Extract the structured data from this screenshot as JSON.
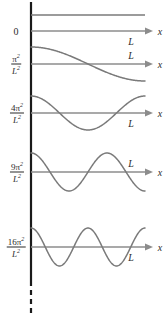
{
  "figure": {
    "axis_x_label": "x",
    "box_length_label": "L",
    "ground_label": "0",
    "colors": {
      "curve": "#7a7a7a",
      "axis": "#8c8c8c",
      "vertical_axis": "#1a1a1a",
      "text": "#2b2b2b",
      "background": "#ffffff"
    },
    "vertical_axis": {
      "x": 31,
      "solid_top": 2,
      "solid_bottom": 281,
      "dashed_bottom": 313
    },
    "levels": [
      {
        "index": 0,
        "energy_numerator": "0",
        "energy_denominator": "",
        "energy_is_fraction": false,
        "axis_y": 31,
        "curve_y": 15,
        "amplitude": 0,
        "half_periods": 0,
        "shape": "flat",
        "L_label_position": "below",
        "L_x": 131,
        "L_y": 41,
        "x_label_x": 160,
        "x_label_y": 31
      },
      {
        "index": 1,
        "energy_numerator": "π²",
        "energy_denominator": "L²",
        "energy_is_fraction": true,
        "axis_y": 64,
        "curve_y": 64,
        "amplitude": 17,
        "half_periods": 1,
        "shape": "cosine",
        "L_label_position": "above",
        "L_x": 131,
        "L_y": 55,
        "x_label_x": 160,
        "x_label_y": 64
      },
      {
        "index": 2,
        "energy_numerator": "4π²",
        "energy_denominator": "L²",
        "energy_is_fraction": true,
        "axis_y": 113,
        "curve_y": 113,
        "amplitude": 17,
        "half_periods": 2,
        "shape": "cosine",
        "L_label_position": "below",
        "L_x": 131,
        "L_y": 123,
        "x_label_x": 160,
        "x_label_y": 113
      },
      {
        "index": 3,
        "energy_numerator": "9π²",
        "energy_denominator": "L²",
        "energy_is_fraction": true,
        "axis_y": 172,
        "curve_y": 172,
        "amplitude": 19,
        "half_periods": 3,
        "shape": "cosine",
        "L_label_position": "above",
        "L_x": 131,
        "L_y": 163,
        "x_label_x": 160,
        "x_label_y": 172
      },
      {
        "index": 4,
        "energy_numerator": "16π²",
        "energy_denominator": "L²",
        "energy_is_fraction": true,
        "axis_y": 247,
        "curve_y": 247,
        "amplitude": 19,
        "half_periods": 4,
        "shape": "cosine",
        "L_label_position": "below",
        "L_x": 131,
        "L_y": 257,
        "x_label_x": 160,
        "x_label_y": 247
      }
    ],
    "label_positions": [
      {
        "x": 16,
        "y": 31
      },
      {
        "x": 16,
        "y": 64
      },
      {
        "x": 17,
        "y": 113
      },
      {
        "x": 17,
        "y": 172
      },
      {
        "x": 16,
        "y": 247
      }
    ],
    "geometry": {
      "curve_start_x": 31,
      "curve_end_x": 145,
      "axis_start_x": 31,
      "axis_end_x": 146,
      "arrow_tip_x": 153
    }
  },
  "chart_data": {
    "type": "line",
    "xlabel": "x",
    "ylabel": "",
    "grid": false,
    "legend": "none",
    "x": [
      0,
      "L"
    ],
    "series": [
      {
        "name": "E = 0",
        "energy": "0",
        "half_periods": 0,
        "values": "constant"
      },
      {
        "name": "E = π²/L²",
        "energy": "π²/L²",
        "half_periods": 1,
        "values": "cos(πx/L)"
      },
      {
        "name": "E = 4π²/L²",
        "energy": "4π²/L²",
        "half_periods": 2,
        "values": "cos(2πx/L)"
      },
      {
        "name": "E = 9π²/L²",
        "energy": "9π²/L²",
        "half_periods": 3,
        "values": "cos(3πx/L)"
      },
      {
        "name": "E = 16π²/L²",
        "energy": "16π²/L²",
        "half_periods": 4,
        "values": "cos(4πx/L)"
      }
    ]
  }
}
